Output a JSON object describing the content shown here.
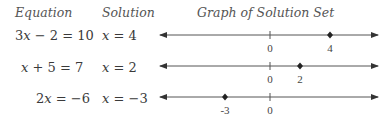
{
  "headers": {
    "equation": "Equation",
    "solution": "Solution",
    "graph": "Graph of Solution Set"
  },
  "rows": [
    {
      "equation_lhs": "3x − 2",
      "equation_rhs": "10",
      "solution_var": "x",
      "solution_value": "4",
      "point": 4,
      "labels": [
        {
          "value": 0,
          "text": "0"
        },
        {
          "value": 4,
          "text": "4"
        }
      ]
    },
    {
      "equation_lhs": "x + 5",
      "equation_rhs": "7",
      "solution_var": "x",
      "solution_value": "2",
      "point": 2,
      "labels": [
        {
          "value": 0,
          "text": "0"
        },
        {
          "value": 2,
          "text": "2"
        }
      ]
    },
    {
      "equation_lhs": "2x",
      "equation_rhs": "−6",
      "solution_var": "x",
      "solution_value": "−3",
      "point": -3,
      "labels": [
        {
          "value": -3,
          "text": "-3"
        },
        {
          "value": 0,
          "text": "0"
        }
      ]
    }
  ],
  "colors": {
    "line": "#555555",
    "point": "#222222"
  }
}
